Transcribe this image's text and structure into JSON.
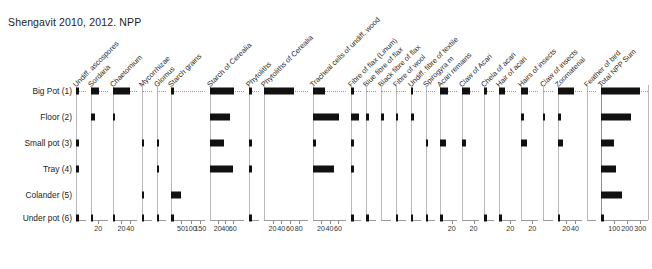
{
  "chart_title": "Shengavit 2010, 2012. NPP",
  "caption": "",
  "colors": {
    "bar": "#111111",
    "axis": "#b9b9b9",
    "text": "#1d1d1d"
  },
  "rows": [
    "Big Pot (1)",
    "Floor (2)",
    "Small pot (3)",
    "Tray (4)",
    "Colander (5)",
    "Under pot (6)"
  ],
  "chart_data": {
    "type": "bar",
    "title": "Shengavit 2010, 2012. NPP",
    "subtitle": "",
    "xlabel": "",
    "ylabel": "",
    "orientation": "horizontal",
    "layout": "stratigraphic pollen-style multi-panel diagram",
    "grid": false,
    "legend": "none",
    "categories": [
      "Big Pot (1)",
      "Floor (2)",
      "Small pot (3)",
      "Tray (4)",
      "Colander (5)",
      "Under pot (6)"
    ],
    "series": [
      {
        "name": "Undiff. ascospores",
        "axis_ticks": [],
        "xmax": 30,
        "values": [
          1,
          0,
          9,
          6,
          0,
          1
        ]
      },
      {
        "name": "Sordaria",
        "axis_ticks": [
          20
        ],
        "xmax": 45,
        "values": [
          22,
          10,
          0,
          0,
          0,
          1
        ]
      },
      {
        "name": "Chaetomium",
        "axis_ticks": [
          20,
          40
        ],
        "xmax": 55,
        "values": [
          40,
          4,
          0,
          0,
          0,
          1
        ]
      },
      {
        "name": "Mycorrhizae",
        "axis_ticks": [],
        "xmax": 30,
        "values": [
          0,
          0,
          4,
          0,
          5,
          1
        ]
      },
      {
        "name": "Glomus",
        "axis_ticks": [],
        "xmax": 30,
        "values": [
          0,
          0,
          4,
          4,
          0,
          1
        ]
      },
      {
        "name": "Starch grains",
        "axis_ticks": [
          50,
          100,
          150
        ],
        "xmax": 175,
        "values": [
          10,
          0,
          0,
          0,
          50,
          2
        ]
      },
      {
        "name": "Starch of Cerealia",
        "axis_ticks": [
          20,
          40,
          60
        ],
        "xmax": 90,
        "values": [
          62,
          52,
          36,
          60,
          0,
          0
        ]
      },
      {
        "name": "Phytoliths",
        "axis_ticks": [],
        "xmax": 30,
        "values": [
          2,
          0,
          3,
          2,
          0,
          8
        ]
      },
      {
        "name": "Phytoliths of Cerealia",
        "axis_ticks": [
          20,
          40,
          60,
          80
        ],
        "xmax": 100,
        "values": [
          68,
          0,
          0,
          0,
          0,
          0
        ]
      },
      {
        "name": "Tracheal cells of undiff. wood",
        "axis_ticks": [
          20,
          40,
          60
        ],
        "xmax": 80,
        "values": [
          30,
          62,
          8,
          50,
          0,
          0
        ]
      },
      {
        "name": "Fibre of flax (Linum)",
        "axis_ticks": [],
        "xmax": 40,
        "values": [
          6,
          30,
          5,
          4,
          0,
          1
        ]
      },
      {
        "name": "Blue fibre of flax",
        "axis_ticks": [],
        "xmax": 30,
        "values": [
          0,
          5,
          0,
          0,
          0,
          1
        ]
      },
      {
        "name": "Black fibre of flax",
        "axis_ticks": [],
        "xmax": 30,
        "values": [
          0,
          5,
          0,
          0,
          0,
          0
        ]
      },
      {
        "name": "Fibre of wool",
        "axis_ticks": [],
        "xmax": 30,
        "values": [
          0,
          4,
          0,
          0,
          0,
          1
        ]
      },
      {
        "name": "Undiff. fibre of textile",
        "axis_ticks": [],
        "xmax": 30,
        "values": [
          4,
          9,
          0,
          0,
          0,
          1
        ]
      },
      {
        "name": "Spirogyra m",
        "axis_ticks": [],
        "xmax": 30,
        "values": [
          0,
          0,
          5,
          0,
          0,
          1
        ]
      },
      {
        "name": "Acari remains",
        "axis_ticks": [
          20
        ],
        "xmax": 30,
        "values": [
          14,
          0,
          10,
          0,
          0,
          1
        ]
      },
      {
        "name": "Claw of Acari",
        "axis_ticks": [
          20
        ],
        "xmax": 30,
        "values": [
          14,
          0,
          6,
          0,
          0,
          0
        ]
      },
      {
        "name": "Chela of acari",
        "axis_ticks": [],
        "xmax": 30,
        "values": [
          5,
          0,
          0,
          0,
          0,
          1
        ]
      },
      {
        "name": "Hair of acari",
        "axis_ticks": [
          20
        ],
        "xmax": 30,
        "values": [
          11,
          0,
          0,
          0,
          0,
          1
        ]
      },
      {
        "name": "Hairs of insects",
        "axis_ticks": [
          20
        ],
        "xmax": 30,
        "values": [
          13,
          5,
          10,
          0,
          0,
          0
        ]
      },
      {
        "name": "Claw of insects",
        "axis_ticks": [],
        "xmax": 30,
        "values": [
          0,
          4,
          0,
          0,
          0,
          0
        ]
      },
      {
        "name": "Zoomaterial",
        "axis_ticks": [
          20,
          40
        ],
        "xmax": 55,
        "values": [
          38,
          7,
          13,
          0,
          0,
          1
        ]
      },
      {
        "name": "Feather of bird",
        "axis_ticks": [],
        "xmax": 30,
        "values": [
          0,
          0,
          0,
          0,
          0,
          0
        ]
      },
      {
        "name": "Total NPP Sum",
        "axis_ticks": [
          100,
          200,
          300
        ],
        "xmax": 360,
        "values": [
          300,
          225,
          100,
          112,
          160,
          3
        ]
      }
    ]
  }
}
